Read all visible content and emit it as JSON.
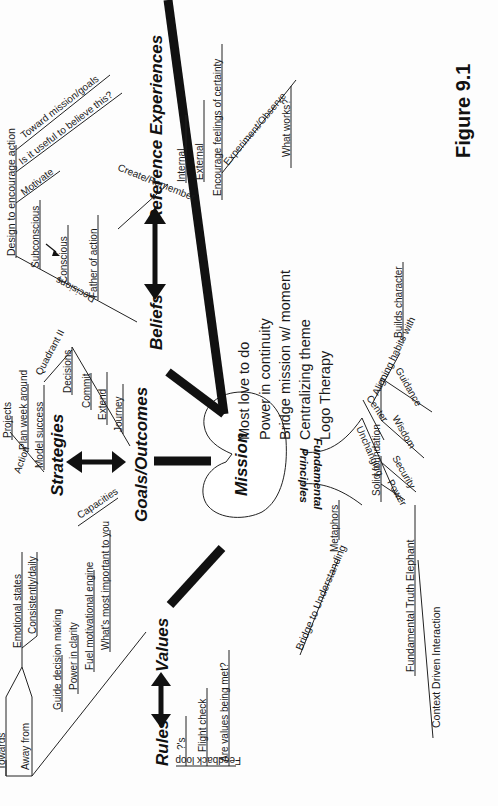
{
  "figure": {
    "label": "Figure 9.1",
    "orientation": "rotated 90 degrees counterclockwise"
  },
  "center": {
    "label": "Mission",
    "items": [
      "Most love to do",
      "Power in continuity",
      "Bridge mission w/ moment",
      "Centralizing theme",
      "Logo Therapy"
    ]
  },
  "hubs": {
    "beliefs": "Beliefs",
    "reference_experiences": "Reference Experiences",
    "goals": "Goals/Outcomes",
    "strategies": "Strategies",
    "values": "Values",
    "rules": "Rules",
    "fundamental_principles": [
      "Fundamental",
      "Principles"
    ]
  },
  "beliefs_branch": {
    "design": "Design to encourage action",
    "design_children": [
      "Toward mission/goals",
      "Is it useful to believe this?",
      "Motivate"
    ],
    "decisions": "Decisions",
    "decisions_children": [
      "Subconscious",
      "Conscious",
      "Father of action"
    ]
  },
  "reference_branch": {
    "create": "Create/Remember",
    "create_children": [
      "Internal",
      "External",
      "Encourage feelings of certainty"
    ],
    "experiment": "Experiment/Observe",
    "experiment_children": [
      "What works?"
    ]
  },
  "strategies_branch": {
    "action": "Action",
    "action_children": [
      "Projects",
      "Plan week around",
      "Model success"
    ],
    "quadrant": "Quadrant II",
    "capacities": "Capacities"
  },
  "goals_branch": {
    "items": [
      "Decisions",
      "Commit",
      "Extend",
      "Journey"
    ]
  },
  "values_branch": {
    "towards": "Towards",
    "away": "Away from",
    "emotional": "Emotional states",
    "consistently": "Consistently/daily",
    "items": [
      "Guide decision making",
      "Power in clarity",
      "Fuel motivational engine",
      "What's most important to you"
    ]
  },
  "rules_branch": {
    "feedback": "Feedback loop",
    "items": [
      "?'s",
      "Flight check",
      "Are values being met?"
    ]
  },
  "principles_branch": {
    "unchanging": "Unchanging",
    "unchanging_children": [
      "Center",
      "Aligning habits with",
      "Builds character"
    ],
    "solid": "Solid foundation",
    "solid_children": [
      "Power",
      "Security",
      "Wisdom",
      "Guidance"
    ],
    "metaphors": "Metaphors",
    "bridge": "Bridge to Understanding",
    "truth": "Fundamental Truth Elephant",
    "context": "Context Driven Interaction"
  }
}
